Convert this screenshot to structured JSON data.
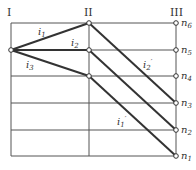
{
  "columns": [
    {
      "label": "I",
      "x": 11
    },
    {
      "label": "II",
      "x": 89
    },
    {
      "label": "III",
      "x": 176
    }
  ],
  "rows_y": [
    23,
    50,
    76,
    103,
    130,
    156
  ],
  "speed_labels": [
    "n6",
    "n5",
    "n4",
    "n3",
    "n2",
    "n1"
  ],
  "speed_labels_display": [
    {
      "base": "n",
      "sub": "6"
    },
    {
      "base": "n",
      "sub": "5"
    },
    {
      "base": "n",
      "sub": "4"
    },
    {
      "base": "n",
      "sub": "3"
    },
    {
      "base": "n",
      "sub": "2"
    },
    {
      "base": "n",
      "sub": "1"
    }
  ],
  "ratio_labels": {
    "i1": {
      "base": "i",
      "sub": "1"
    },
    "i2": {
      "base": "i",
      "sub": "2"
    },
    "i3": {
      "base": "i",
      "sub": "3"
    },
    "i2p": {
      "base": "i",
      "sub": "2",
      "prime": "′"
    },
    "i1p": {
      "base": "i",
      "sub": "1",
      "prime": "′"
    }
  },
  "colors": {
    "line": "#333333",
    "grid": "#555555"
  }
}
